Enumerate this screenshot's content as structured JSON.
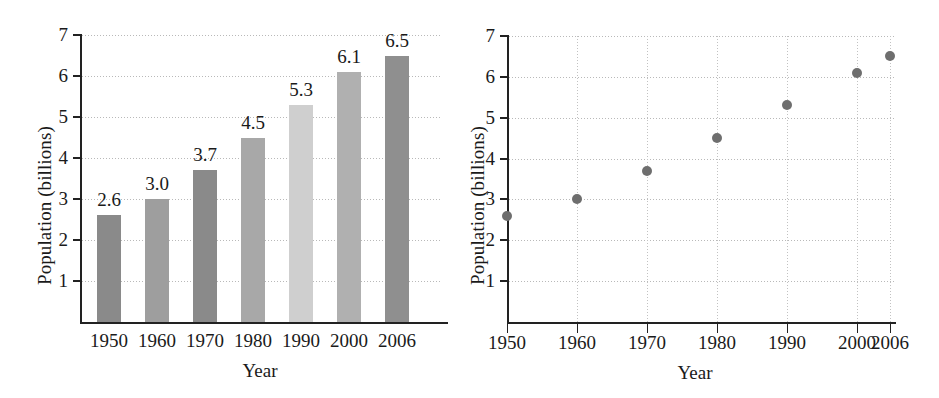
{
  "chart_data": [
    {
      "type": "bar",
      "panel": "left",
      "title": "",
      "xlabel": "Year",
      "ylabel": "Population (billions)",
      "categories": [
        "1950",
        "1960",
        "1970",
        "1980",
        "1990",
        "2000",
        "2006"
      ],
      "values": [
        2.6,
        3.0,
        3.7,
        4.5,
        5.3,
        6.1,
        6.5
      ],
      "value_labels": [
        "2.6",
        "3.0",
        "3.7",
        "4.5",
        "5.3",
        "6.1",
        "6.5"
      ],
      "bar_colors": [
        "#8a8a8a",
        "#9e9e9e",
        "#8a8a8a",
        "#a8a8a8",
        "#cfcfcf",
        "#b0b0b0",
        "#8f8f8f"
      ],
      "ytick_labels": [
        "1",
        "2",
        "3",
        "4",
        "5",
        "6",
        "7"
      ],
      "yticks": [
        1,
        2,
        3,
        4,
        5,
        6,
        7
      ],
      "ylim": [
        0,
        7
      ],
      "grid": "horizontal-dotted"
    },
    {
      "type": "scatter",
      "panel": "right",
      "title": "",
      "xlabel": "Year",
      "ylabel": "Population (billions)",
      "categories": [
        "1950",
        "1960",
        "1970",
        "1980",
        "1990",
        "2000",
        "2006"
      ],
      "x": [
        1950,
        1960,
        1970,
        1980,
        1990,
        2000,
        2006
      ],
      "values": [
        2.6,
        3.0,
        3.7,
        4.5,
        5.3,
        6.1,
        6.5
      ],
      "marker_color": "#6e6e6e",
      "ytick_labels": [
        "1",
        "2",
        "3",
        "4",
        "5",
        "6",
        "7"
      ],
      "yticks": [
        1,
        2,
        3,
        4,
        5,
        6,
        7
      ],
      "ylim": [
        0,
        7
      ],
      "grid": "both-dotted"
    }
  ]
}
